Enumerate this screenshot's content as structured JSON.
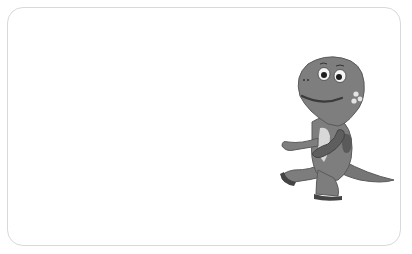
{
  "card": {
    "border_color": "#d9d9d9",
    "background": "#ffffff"
  },
  "illustration": {
    "subject": "cartoon dinosaur walking",
    "style": "grayscale",
    "body_color": "#7a7a7a",
    "belly_color": "#d8d8d8",
    "spot_color": "#555555"
  }
}
